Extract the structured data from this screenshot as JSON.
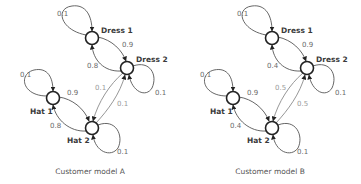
{
  "diagrams": [
    {
      "caption": "Customer model A",
      "nodes": {
        "dress1": "Dress 1",
        "dress2": "Dress 2",
        "hat1": "Hat 1",
        "hat2": "Hat 2"
      },
      "edges": {
        "dress1_self": "0.1",
        "dress1_to_dress2": "0.9",
        "dress2_to_dress1": "0.8",
        "dress2_self": "0.1",
        "hat1_self": "0.1",
        "hat1_to_hat2": "0.9",
        "hat2_to_hat1": "0.8",
        "hat2_self": "0.1",
        "dress2_to_hat2": "0.1",
        "hat2_to_dress2": "0.1"
      }
    },
    {
      "caption": "Customer model B",
      "nodes": {
        "dress1": "Dress 1",
        "dress2": "Dress 2",
        "hat1": "Hat 1",
        "hat2": "Hat 2"
      },
      "edges": {
        "dress1_self": "0.1",
        "dress1_to_dress2": "0.9",
        "dress2_to_dress1": "0.4",
        "dress2_self": "0.1",
        "hat1_self": "0.1",
        "hat1_to_hat2": "0.9",
        "hat2_to_hat1": "0.4",
        "hat2_self": "0.1",
        "dress2_to_hat2": "0.5",
        "hat2_to_dress2": "0.5"
      }
    }
  ]
}
